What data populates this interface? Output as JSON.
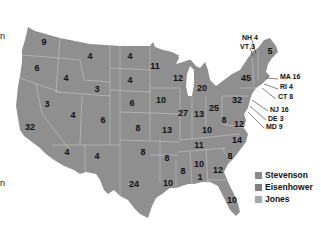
{
  "colors": {
    "state_fill": "#8f8f8f",
    "state_border": "#c8c8c8",
    "background": "#ffffff",
    "text": "#111111",
    "stevenson": "#8a8a8a",
    "eisenhower": "#7e7e7e",
    "jones": "#a6a6a6"
  },
  "edge_fragments": [
    "n",
    "n"
  ],
  "states": [
    {
      "id": "WA",
      "votes": "9",
      "x": 44,
      "y": 42
    },
    {
      "id": "OR",
      "votes": "6",
      "x": 37,
      "y": 68
    },
    {
      "id": "CA",
      "votes": "32",
      "x": 30,
      "y": 127
    },
    {
      "id": "NV",
      "votes": "3",
      "x": 47,
      "y": 104
    },
    {
      "id": "ID",
      "votes": "4",
      "x": 66,
      "y": 78
    },
    {
      "id": "MT",
      "votes": "4",
      "x": 90,
      "y": 56
    },
    {
      "id": "WY",
      "votes": "3",
      "x": 97,
      "y": 89
    },
    {
      "id": "UT",
      "votes": "4",
      "x": 73,
      "y": 115
    },
    {
      "id": "CO",
      "votes": "6",
      "x": 103,
      "y": 120
    },
    {
      "id": "AZ",
      "votes": "4",
      "x": 67,
      "y": 152
    },
    {
      "id": "NM",
      "votes": "4",
      "x": 97,
      "y": 156
    },
    {
      "id": "ND",
      "votes": "4",
      "x": 130,
      "y": 56
    },
    {
      "id": "SD",
      "votes": "4",
      "x": 130,
      "y": 80
    },
    {
      "id": "NE",
      "votes": "6",
      "x": 132,
      "y": 103
    },
    {
      "id": "KS",
      "votes": "8",
      "x": 138,
      "y": 128
    },
    {
      "id": "OK",
      "votes": "8",
      "x": 143,
      "y": 152
    },
    {
      "id": "TX",
      "votes": "24",
      "x": 134,
      "y": 184
    },
    {
      "id": "MN",
      "votes": "11",
      "x": 155,
      "y": 66
    },
    {
      "id": "IA",
      "votes": "10",
      "x": 161,
      "y": 100
    },
    {
      "id": "MO",
      "votes": "13",
      "x": 167,
      "y": 130
    },
    {
      "id": "AR",
      "votes": "8",
      "x": 167,
      "y": 158
    },
    {
      "id": "LA",
      "votes": "10",
      "x": 168,
      "y": 183
    },
    {
      "id": "WI",
      "votes": "12",
      "x": 178,
      "y": 78
    },
    {
      "id": "IL",
      "votes": "27",
      "x": 183,
      "y": 113
    },
    {
      "id": "MI",
      "votes": "20",
      "x": 202,
      "y": 88
    },
    {
      "id": "IN",
      "votes": "13",
      "x": 199,
      "y": 114
    },
    {
      "id": "OH",
      "votes": "25",
      "x": 214,
      "y": 108
    },
    {
      "id": "KY",
      "votes": "10",
      "x": 207,
      "y": 130
    },
    {
      "id": "TN",
      "votes": "11",
      "x": 199,
      "y": 145
    },
    {
      "id": "MS",
      "votes": "8",
      "x": 183,
      "y": 171
    },
    {
      "id": "AL",
      "votes": "10",
      "x": 199,
      "y": 164
    },
    {
      "id": "AL2",
      "votes": "1",
      "x": 200,
      "y": 177
    },
    {
      "id": "GA",
      "votes": "12",
      "x": 218,
      "y": 170
    },
    {
      "id": "FL",
      "votes": "10",
      "x": 232,
      "y": 200
    },
    {
      "id": "SC",
      "votes": "8",
      "x": 230,
      "y": 156
    },
    {
      "id": "NC",
      "votes": "14",
      "x": 237,
      "y": 140
    },
    {
      "id": "VA",
      "votes": "12",
      "x": 239,
      "y": 124
    },
    {
      "id": "WV",
      "votes": "8",
      "x": 224,
      "y": 120
    },
    {
      "id": "PA",
      "votes": "32",
      "x": 237,
      "y": 100
    },
    {
      "id": "NY",
      "votes": "45",
      "x": 246,
      "y": 78
    },
    {
      "id": "ME",
      "votes": "5",
      "x": 270,
      "y": 51
    }
  ],
  "callouts": [
    {
      "id": "NH",
      "text": "NH 4",
      "x": 242,
      "y": 37
    },
    {
      "id": "VT",
      "text": "VT 3",
      "x": 240,
      "y": 46
    },
    {
      "id": "MA",
      "text": "MA 16",
      "x": 280,
      "y": 76
    },
    {
      "id": "RI",
      "text": "RI 4",
      "x": 280,
      "y": 86
    },
    {
      "id": "CT",
      "text": "CT 8",
      "x": 278,
      "y": 96
    },
    {
      "id": "NJ",
      "text": "NJ 16",
      "x": 270,
      "y": 109
    },
    {
      "id": "DE",
      "text": "DE 3",
      "x": 268,
      "y": 118
    },
    {
      "id": "MD",
      "text": "MD 9",
      "x": 266,
      "y": 126
    }
  ],
  "legend": [
    {
      "label": "Stevenson",
      "color": "#8a8a8a"
    },
    {
      "label": "Eisenhower",
      "color": "#7e7e7e"
    },
    {
      "label": "Jones",
      "color": "#a6a6a6"
    }
  ]
}
